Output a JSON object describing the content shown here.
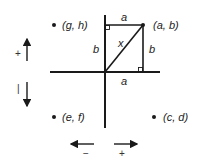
{
  "diagram": {
    "points": [
      {
        "label": "(g, h)",
        "quadrant": "upper-left"
      },
      {
        "label": "(a, b)",
        "quadrant": "upper-right"
      },
      {
        "label": "(e, f)",
        "quadrant": "lower-left"
      },
      {
        "label": "(c, d)",
        "quadrant": "lower-right"
      }
    ],
    "triangle": {
      "top_side": "a",
      "left_side": "b",
      "hypotenuse": "x",
      "right_side": "b",
      "bottom_side": "a"
    },
    "vertical_direction": {
      "up": "+",
      "down": "|"
    },
    "horizontal_direction": {
      "left": "−",
      "right": "+"
    },
    "colors": {
      "line": "#1a1a1a",
      "background": "#ffffff"
    }
  }
}
